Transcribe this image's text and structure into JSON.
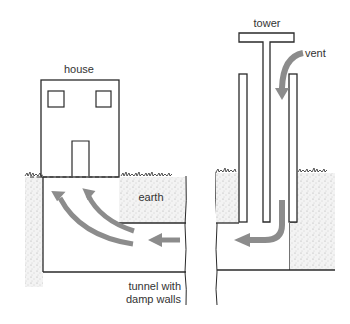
{
  "labels": {
    "house": "house",
    "earth": "earth",
    "tunnel_line1": "tunnel with",
    "tunnel_line2": "damp walls",
    "tower": "tower",
    "vent": "vent"
  },
  "colors": {
    "line": "#2a2a2a",
    "arrow": "#8c8c8c",
    "arrow_stroke": "#6e6e6e",
    "earth_fill": "#f1f1f1",
    "earth_dot": "#9a9a9a"
  }
}
